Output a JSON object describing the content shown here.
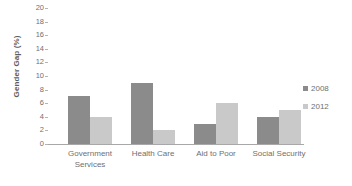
{
  "chart_data": {
    "type": "bar",
    "title": "",
    "xlabel": "",
    "ylabel": "Gender Gap (%)",
    "ylim": [
      0,
      20
    ],
    "ytick_step": 2,
    "yticks": [
      20,
      18,
      16,
      14,
      12,
      10,
      8,
      6,
      4,
      2,
      0
    ],
    "grid": false,
    "legend_position": "right",
    "categories": [
      "Government Services",
      "Health Care",
      "Aid to Poor",
      "Social Security"
    ],
    "category_lines": [
      [
        "Government",
        "Services"
      ],
      [
        "Health Care"
      ],
      [
        "Aid to Poor"
      ],
      [
        "Social Security"
      ]
    ],
    "series": [
      {
        "name": "2008",
        "color": "#8b8b8b",
        "values": [
          7,
          9,
          3,
          4
        ]
      },
      {
        "name": "2012",
        "color": "#c9c9c9",
        "values": [
          4,
          2,
          6,
          5
        ]
      }
    ]
  },
  "legend": {
    "items": [
      {
        "label": "2008",
        "color": "#8b8b8b"
      },
      {
        "label": "2012",
        "color": "#c9c9c9"
      }
    ]
  },
  "axis": {
    "y_title": "Gender Gap (%)",
    "tick_labels": [
      "20",
      "18",
      "16",
      "14",
      "12",
      "10",
      "8",
      "6",
      "4",
      "2",
      "0"
    ]
  }
}
